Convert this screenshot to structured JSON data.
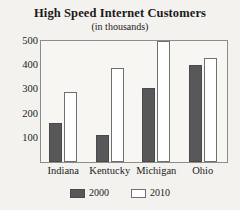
{
  "chart_data": {
    "type": "bar",
    "title": "High Speed Internet Customers",
    "subtitle": "(in thousands)",
    "xlabel": "",
    "ylabel": "",
    "ylim": [
      0,
      500
    ],
    "yticks": [
      100,
      200,
      300,
      400,
      500
    ],
    "ytick_labels": [
      "100",
      "200",
      "300",
      "400",
      "500"
    ],
    "grid": false,
    "legend_position": "bottom",
    "categories": [
      "Indiana",
      "Kentucky",
      "Michigan",
      "Ohio"
    ],
    "series": [
      {
        "name": "2000",
        "color": "#58585a",
        "values": [
          160,
          110,
          305,
          400
        ]
      },
      {
        "name": "2010",
        "color": "#ffffff",
        "values": [
          290,
          390,
          500,
          430
        ]
      }
    ]
  },
  "colors": {
    "background": "#f4f2ef",
    "plot_background": "#f7f6f3",
    "frame": "#8c8c8c",
    "series_2000": "#58585a",
    "series_2010": "#ffffff",
    "text": "#1a1a1a"
  }
}
